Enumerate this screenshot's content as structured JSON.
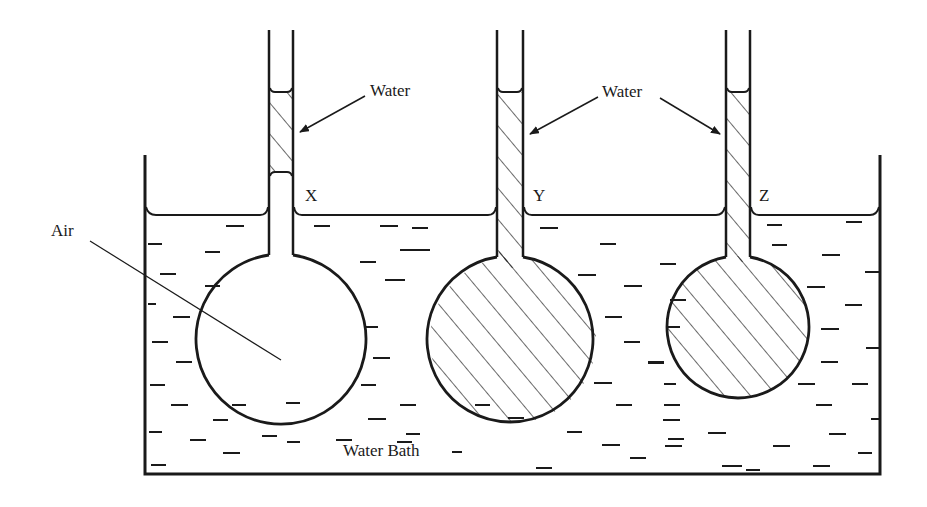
{
  "figure": {
    "type": "diagram",
    "colors": {
      "line": "#1a1a1a",
      "background": "#ffffff"
    }
  },
  "labels": {
    "water_x": "Water",
    "water_yz": "Water",
    "bulb_x": "X",
    "bulb_y": "Y",
    "bulb_z": "Z",
    "air": "Air",
    "water_bath": "Water Bath"
  },
  "bulbs": [
    {
      "id": "X",
      "contents": "Air",
      "tube_water_column": "short plug in tube above bath surface"
    },
    {
      "id": "Y",
      "contents": "Water",
      "tube_water_column": "filled to top level"
    },
    {
      "id": "Z",
      "contents": "Water",
      "tube_water_column": "filled to top level",
      "size": "smaller"
    }
  ]
}
